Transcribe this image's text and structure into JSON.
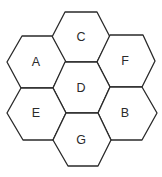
{
  "diagram": {
    "type": "hexagonal-cell-layout",
    "stroke_color": "#2a2a2a",
    "fill_color": "#ffffff",
    "cells": [
      {
        "label": "C",
        "cx": 81,
        "cy": 37
      },
      {
        "label": "A",
        "cx": 37,
        "cy": 62
      },
      {
        "label": "F",
        "cx": 126,
        "cy": 61
      },
      {
        "label": "D",
        "cx": 81,
        "cy": 88
      },
      {
        "label": "E",
        "cx": 37,
        "cy": 114
      },
      {
        "label": "B",
        "cx": 126,
        "cy": 113
      },
      {
        "label": "G",
        "cx": 82,
        "cy": 140
      }
    ]
  }
}
